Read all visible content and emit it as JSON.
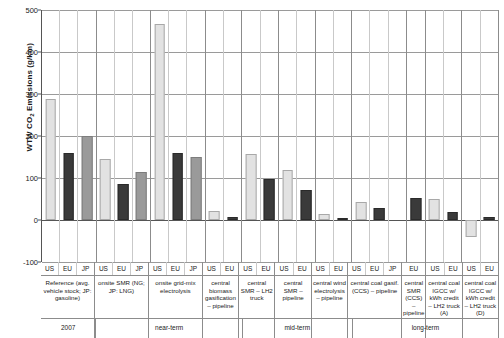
{
  "chart": {
    "type": "bar",
    "y_axis_title_main": "WTW CO",
    "y_axis_title_sub": "2",
    "y_axis_title_rest": " Emissions (g/km)",
    "yticks": [
      "500",
      "400",
      "300",
      "200",
      "100",
      "0",
      "-100"
    ]
  },
  "chart_data": {
    "type": "bar",
    "title": "",
    "xlabel": "",
    "ylabel": "WTW CO2 Emissions (g/km)",
    "ylim": [
      -100,
      500
    ],
    "yticks": [
      -100,
      0,
      100,
      200,
      300,
      400,
      500
    ],
    "grid": true,
    "legend": "none",
    "series": [
      {
        "name": "US",
        "color": "#e2e2e2"
      },
      {
        "name": "EU",
        "color": "#3a3a3a"
      },
      {
        "name": "JP",
        "color": "#9a9a9a"
      }
    ],
    "groups": [
      {
        "label": "Reference (avg. vehicle stock; JP: gasoline)",
        "era": "2007",
        "regions": [
          "US",
          "EU",
          "JP"
        ],
        "values": [
          288,
          160,
          200
        ]
      },
      {
        "label": "onsite SMR (NG; JP: LNG)",
        "era": "near-term",
        "regions": [
          "US",
          "EU",
          "JP"
        ],
        "values": [
          145,
          85,
          114
        ]
      },
      {
        "label": "onsite grid-mix electrolysis",
        "era": "near-term",
        "regions": [
          "US",
          "EU",
          "JP"
        ],
        "values": [
          466,
          159,
          150
        ]
      },
      {
        "label": "central biomass gasification – pipeline",
        "era": "near-term",
        "regions": [
          "US",
          "EU"
        ],
        "values": [
          22,
          8
        ]
      },
      {
        "label": "central SMR – LH2 truck",
        "era": "mid-term",
        "regions": [
          "US",
          "EU"
        ],
        "values": [
          157,
          97
        ]
      },
      {
        "label": "central SMR – pipeline",
        "era": "mid-term",
        "regions": [
          "US",
          "EU"
        ],
        "values": [
          120,
          72
        ]
      },
      {
        "label": "central wind electrolysis – pipeline",
        "era": "mid-term",
        "regions": [
          "US",
          "EU"
        ],
        "values": [
          15,
          5
        ]
      },
      {
        "label": "central coal gasif. (CCS) – pipeline",
        "era": "long-term",
        "regions": [
          "US",
          "EU",
          "JP"
        ],
        "values": [
          42,
          28,
          null
        ]
      },
      {
        "label": "central SMR (CCS) – pipeline",
        "era": "long-term",
        "regions": [
          "EU"
        ],
        "values": [
          53
        ]
      },
      {
        "label": "central coal IGCC w/ kWh credit – LH2 truck (A)",
        "era": "long-term",
        "regions": [
          "US",
          "EU"
        ],
        "values": [
          50,
          18
        ]
      },
      {
        "label": "central coal IGCC w/ kWh credit – LH2 truck (D)",
        "era": "long-term",
        "regions": [
          "US",
          "EU"
        ],
        "values": [
          -40,
          8
        ]
      }
    ],
    "eras": [
      {
        "label": "2007",
        "span": 1
      },
      {
        "label": "near-term",
        "span": 3
      },
      {
        "label": "mid-term",
        "span": 3
      },
      {
        "label": "long-term",
        "span": 4
      }
    ]
  }
}
